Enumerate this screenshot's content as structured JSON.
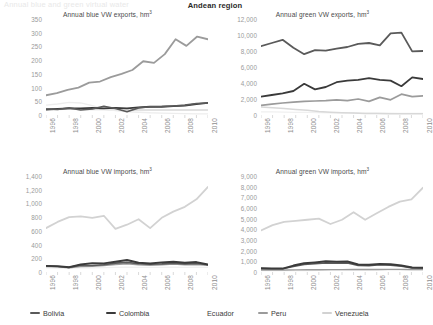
{
  "header": {
    "faint_left_text": "Annual blue and green virtual water",
    "title": "Andean region"
  },
  "legend": {
    "items": [
      {
        "label": "Bolivia",
        "color": "#5a5a5a",
        "x": 30,
        "swatch_visible": true
      },
      {
        "label": "Colombia",
        "color": "#3a3a3a",
        "x": 106,
        "swatch_visible": true
      },
      {
        "label": "Ecuador",
        "color": "#f2f2f2",
        "x": 194,
        "swatch_visible": false
      },
      {
        "label": "Peru",
        "color": "#9b9b9b",
        "x": 258,
        "swatch_visible": true
      },
      {
        "label": "Venezuela",
        "color": "#d2d2d2",
        "x": 322,
        "swatch_visible": true
      }
    ]
  },
  "chart_data": [
    {
      "id": "blue-exports",
      "position": "top-left",
      "type": "line",
      "title": "Annual blue VW exports, hm",
      "title_sup": "3",
      "xlabel": "",
      "ylabel": "",
      "ylim": [
        0,
        350
      ],
      "yticks": [
        0,
        50,
        100,
        150,
        200,
        250,
        300,
        350
      ],
      "ytick_labels": [
        "0",
        "50",
        "100",
        "150",
        "200",
        "250",
        "300",
        "350"
      ],
      "xlim": [
        1996,
        2010
      ],
      "x": [
        1996,
        1997,
        1998,
        1999,
        2000,
        2001,
        2002,
        2003,
        2004,
        2005,
        2006,
        2007,
        2008,
        2009,
        2010
      ],
      "xtick_labels": [
        "1996",
        "1998",
        "2000",
        "2002",
        "2004",
        "2006",
        "2008",
        "2010"
      ],
      "grid": false,
      "series": [
        {
          "name": "Bolivia",
          "color": "#5a5a5a",
          "width": 1.6,
          "values": [
            22,
            20,
            26,
            18,
            22,
            32,
            24,
            12,
            26,
            30,
            31,
            33,
            36,
            42,
            44
          ]
        },
        {
          "name": "Colombia",
          "color": "#3a3a3a",
          "width": 1.8,
          "values": [
            20,
            22,
            24,
            24,
            26,
            24,
            26,
            24,
            28,
            30,
            30,
            32,
            34,
            40,
            44
          ]
        },
        {
          "name": "Ecuador",
          "color": "#ededed",
          "width": 1.4,
          "values": [
            36,
            40,
            46,
            44,
            34,
            22,
            16,
            12,
            10,
            8,
            7,
            6,
            5,
            4,
            4
          ]
        },
        {
          "name": "Peru",
          "color": "#9b9b9b",
          "width": 1.8,
          "values": [
            72,
            80,
            92,
            100,
            118,
            122,
            138,
            150,
            164,
            196,
            190,
            222,
            276,
            252,
            286,
            276
          ]
        },
        {
          "name": "Venezuela",
          "color": "#d8d8d8",
          "width": 1.4,
          "values": [
            20,
            20,
            22,
            20,
            20,
            20,
            18,
            18,
            18,
            18,
            18,
            18,
            18,
            18,
            18
          ]
        }
      ]
    },
    {
      "id": "green-exports",
      "position": "top-right",
      "type": "line",
      "title": "Annual green VW exports, hm",
      "title_sup": "3",
      "xlabel": "",
      "ylabel": "",
      "ylim": [
        0,
        12000
      ],
      "yticks": [
        0,
        2000,
        4000,
        6000,
        8000,
        10000,
        12000
      ],
      "ytick_labels": [
        "0",
        "2,000",
        "4,000",
        "6,000",
        "8,000",
        "10,000",
        "12,000"
      ],
      "xlim": [
        1996,
        2010
      ],
      "x": [
        1996,
        1997,
        1998,
        1999,
        2000,
        2001,
        2002,
        2003,
        2004,
        2005,
        2006,
        2007,
        2008,
        2009,
        2010
      ],
      "xtick_labels": [
        "1996",
        "1998",
        "2000",
        "2002",
        "2004",
        "2006",
        "2008",
        "2010"
      ],
      "grid": false,
      "series": [
        {
          "name": "Bolivia",
          "color": "#5a5a5a",
          "width": 1.8,
          "values": [
            8600,
            9000,
            9400,
            8400,
            7600,
            8100,
            8050,
            8300,
            8500,
            8900,
            9000,
            8700,
            10200,
            10300,
            7950,
            8000
          ]
        },
        {
          "name": "Colombia",
          "color": "#3a3a3a",
          "width": 1.8,
          "values": [
            2300,
            2500,
            2700,
            3000,
            3900,
            3200,
            3500,
            4100,
            4300,
            4400,
            4600,
            4400,
            4300,
            3600,
            4700,
            4500
          ]
        },
        {
          "name": "Peru",
          "color": "#9b9b9b",
          "width": 1.7,
          "values": [
            1200,
            1350,
            1500,
            1600,
            1700,
            1750,
            1800,
            1900,
            1800,
            2000,
            1700,
            2200,
            1900,
            2600,
            2300,
            2400
          ]
        },
        {
          "name": "Venezuela",
          "color": "#d8d8d8",
          "width": 1.5,
          "values": [
            1000,
            900,
            800,
            700,
            600,
            450,
            350,
            280,
            240,
            200,
            180,
            160,
            150,
            150,
            150
          ]
        },
        {
          "name": "Ecuador",
          "color": "#f0f0f0",
          "width": 1.3,
          "values": [
            400,
            380,
            360,
            340,
            320,
            300,
            280,
            260,
            250,
            240,
            230,
            220,
            210,
            200,
            200
          ]
        }
      ]
    },
    {
      "id": "blue-imports",
      "position": "bottom-left",
      "type": "line",
      "title": "Annual blue VW imports, hm",
      "title_sup": "3",
      "xlabel": "",
      "ylabel": "",
      "ylim": [
        0,
        1400
      ],
      "yticks": [
        0,
        200,
        400,
        600,
        800,
        1000,
        1200,
        1400
      ],
      "ytick_labels": [
        "0",
        "200",
        "400",
        "600",
        "800",
        "1,000",
        "1,200",
        "1,400"
      ],
      "xlim": [
        1996,
        2010
      ],
      "x": [
        1996,
        1997,
        1998,
        1999,
        2000,
        2001,
        2002,
        2003,
        2004,
        2005,
        2006,
        2007,
        2008,
        2009,
        2010
      ],
      "xtick_labels": [
        "1996",
        "1998",
        "2000",
        "2002",
        "2004",
        "2006",
        "2008",
        "2010"
      ],
      "grid": false,
      "series": [
        {
          "name": "Venezuela",
          "color": "#d2d2d2",
          "width": 1.8,
          "values": [
            640,
            730,
            800,
            810,
            790,
            820,
            630,
            690,
            770,
            640,
            790,
            880,
            950,
            1060,
            1240
          ]
        },
        {
          "name": "Colombia",
          "color": "#3a3a3a",
          "width": 1.9,
          "values": [
            90,
            85,
            70,
            110,
            130,
            125,
            150,
            175,
            135,
            125,
            140,
            150,
            135,
            145,
            110
          ]
        },
        {
          "name": "Bolivia",
          "color": "#5a5a5a",
          "width": 1.6,
          "values": [
            88,
            80,
            68,
            100,
            95,
            105,
            130,
            140,
            120,
            112,
            118,
            130,
            118,
            125,
            105
          ]
        },
        {
          "name": "Peru",
          "color": "#9b9b9b",
          "width": 1.5,
          "values": [
            80,
            75,
            62,
            80,
            85,
            95,
            110,
            120,
            105,
            100,
            105,
            115,
            105,
            110,
            100
          ]
        },
        {
          "name": "Ecuador",
          "color": "#f0f0f0",
          "width": 1.3,
          "values": [
            60,
            58,
            55,
            60,
            62,
            65,
            68,
            70,
            68,
            66,
            68,
            70,
            68,
            70,
            68
          ]
        }
      ]
    },
    {
      "id": "green-imports",
      "position": "bottom-right",
      "type": "line",
      "title": "Annual green VW imports, hm",
      "title_sup": "3",
      "xlabel": "",
      "ylabel": "",
      "ylim": [
        0,
        9000
      ],
      "yticks": [
        0,
        1000,
        2000,
        3000,
        4000,
        5000,
        6000,
        7000,
        8000,
        9000
      ],
      "ytick_labels": [
        "0",
        "1,000",
        "2,000",
        "3,000",
        "4,000",
        "5,000",
        "6,000",
        "7,000",
        "8,000",
        "9,000"
      ],
      "xlim": [
        1996,
        2010
      ],
      "x": [
        1996,
        1997,
        1998,
        1999,
        2000,
        2001,
        2002,
        2003,
        2004,
        2005,
        2006,
        2007,
        2008,
        2009,
        2010
      ],
      "xtick_labels": [
        "1996",
        "1998",
        "2000",
        "2002",
        "2004",
        "2006",
        "2008",
        "2010"
      ],
      "grid": false,
      "series": [
        {
          "name": "Venezuela",
          "color": "#d2d2d2",
          "width": 1.8,
          "values": [
            3900,
            4400,
            4700,
            4800,
            4900,
            5000,
            4500,
            4900,
            5600,
            4900,
            5500,
            6100,
            6600,
            6800,
            7900
          ]
        },
        {
          "name": "Colombia",
          "color": "#3a3a3a",
          "width": 2.0,
          "values": [
            340,
            330,
            320,
            600,
            820,
            900,
            1000,
            950,
            980,
            700,
            680,
            760,
            720,
            600,
            420,
            400
          ]
        },
        {
          "name": "Bolivia",
          "color": "#5a5a5a",
          "width": 1.6,
          "values": [
            320,
            310,
            300,
            520,
            700,
            780,
            860,
            830,
            850,
            620,
            600,
            680,
            640,
            540,
            390,
            370
          ]
        },
        {
          "name": "Peru",
          "color": "#9b9b9b",
          "width": 1.4,
          "values": [
            180,
            185,
            190,
            200,
            210,
            215,
            220,
            225,
            230,
            235,
            240,
            250,
            245,
            240,
            230
          ]
        },
        {
          "name": "Ecuador",
          "color": "#f0f0f0",
          "width": 1.3,
          "values": [
            120,
            125,
            130,
            135,
            140,
            145,
            150,
            155,
            160,
            165,
            170,
            175,
            175,
            175,
            175
          ]
        }
      ]
    }
  ]
}
